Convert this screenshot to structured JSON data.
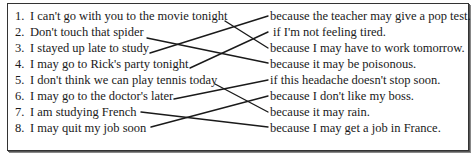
{
  "exercise": {
    "left_items": [
      {
        "number": "1.",
        "text": "I can't go with you to the movie tonight"
      },
      {
        "number": "2.",
        "text": "Don't touch that spider"
      },
      {
        "number": "3.",
        "text": "I stayed up late to study"
      },
      {
        "number": "4.",
        "text": "I may go to Rick's party tonight"
      },
      {
        "number": "5.",
        "text": "I don't think we can play tennis today"
      },
      {
        "number": "6.",
        "text": "I may go to the doctor's later"
      },
      {
        "number": "7.",
        "text": "I am studying French"
      },
      {
        "number": "8.",
        "text": "I may quit my job soon"
      }
    ],
    "right_items": [
      {
        "text": "because the teacher may give a pop test."
      },
      {
        "text": "if I'm not feeling tired."
      },
      {
        "text": "because I may have to work tomorrow."
      },
      {
        "text": "because it may be poisonous."
      },
      {
        "text": "if this headache doesn't stop soon."
      },
      {
        "text": "because I don't like my boss."
      },
      {
        "text": "because it may rain."
      },
      {
        "text": "because I may get a job in France."
      }
    ],
    "matches": [
      {
        "left": 1,
        "right": 3
      },
      {
        "left": 2,
        "right": 4
      },
      {
        "left": 3,
        "right": 1
      },
      {
        "left": 4,
        "right": 2
      },
      {
        "left": 5,
        "right": 7
      },
      {
        "left": 6,
        "right": 5
      },
      {
        "left": 7,
        "right": 8
      },
      {
        "left": 8,
        "right": 6
      }
    ],
    "line_color": "#1a1a1a",
    "border_color": "#333333"
  }
}
